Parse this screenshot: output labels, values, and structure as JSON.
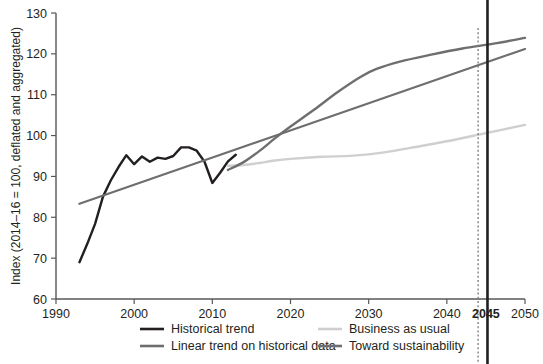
{
  "chart_data": {
    "type": "line",
    "title": "",
    "xlabel": "",
    "ylabel": "Index (2014–16 = 100, deflated and aggregated)",
    "xlim": [
      1990,
      2050
    ],
    "ylim": [
      60,
      130
    ],
    "xticks": [
      1990,
      2000,
      2010,
      2020,
      2030,
      2040,
      2050
    ],
    "yticks": [
      60,
      70,
      80,
      90,
      100,
      110,
      120,
      130
    ],
    "grid": false,
    "legend_position": "bottom",
    "annotations": [
      {
        "name": "target-year-marker",
        "label": "2045",
        "x": 2045,
        "style": "bold-vertical-line"
      },
      {
        "name": "target-year-dotted",
        "x": 2044,
        "style": "dotted-vertical-line"
      }
    ],
    "series": [
      {
        "name": "Historical trend",
        "color": "#231f20",
        "width": 2.4,
        "points": [
          [
            1993,
            69.0
          ],
          [
            1994,
            73.5
          ],
          [
            1995,
            78.4
          ],
          [
            1996,
            85.0
          ],
          [
            1997,
            89.0
          ],
          [
            1998,
            92.3
          ],
          [
            1999,
            95.2
          ],
          [
            2000,
            93.0
          ],
          [
            2001,
            94.9
          ],
          [
            2002,
            93.6
          ],
          [
            2003,
            94.6
          ],
          [
            2004,
            94.3
          ],
          [
            2005,
            95.0
          ],
          [
            2006,
            97.1
          ],
          [
            2007,
            97.1
          ],
          [
            2008,
            96.3
          ],
          [
            2009,
            93.6
          ],
          [
            2010,
            88.4
          ],
          [
            2011,
            90.9
          ],
          [
            2012,
            93.7
          ],
          [
            2013,
            95.3
          ]
        ]
      },
      {
        "name": "Linear trend on historical data",
        "color": "#6e6e70",
        "width": 2.2,
        "points": [
          [
            1993,
            83.3
          ],
          [
            2050,
            121.2
          ]
        ]
      },
      {
        "name": "Business as usual",
        "color": "#cfcfd1",
        "width": 2.4,
        "points": [
          [
            2012,
            92.6
          ],
          [
            2014,
            92.8
          ],
          [
            2016,
            93.3
          ],
          [
            2018,
            93.9
          ],
          [
            2020,
            94.3
          ],
          [
            2024,
            94.8
          ],
          [
            2028,
            95.1
          ],
          [
            2032,
            95.9
          ],
          [
            2036,
            97.2
          ],
          [
            2040,
            98.6
          ],
          [
            2045,
            100.6
          ],
          [
            2050,
            102.6
          ]
        ]
      },
      {
        "name": "Toward sustainability",
        "color": "#6e6e70",
        "width": 2.4,
        "points": [
          [
            2012,
            91.6
          ],
          [
            2014,
            93.5
          ],
          [
            2016,
            96.2
          ],
          [
            2018,
            99.3
          ],
          [
            2020,
            102.2
          ],
          [
            2023,
            106.3
          ],
          [
            2026,
            110.6
          ],
          [
            2029,
            114.4
          ],
          [
            2031,
            116.3
          ],
          [
            2034,
            118.1
          ],
          [
            2038,
            119.8
          ],
          [
            2042,
            121.3
          ],
          [
            2046,
            122.5
          ],
          [
            2050,
            123.9
          ]
        ]
      }
    ],
    "legend": [
      {
        "label": "Historical trend",
        "color": "#231f20",
        "column": 0,
        "row": 0
      },
      {
        "label": "Linear trend on historical data",
        "color": "#6e6e70",
        "column": 0,
        "row": 1
      },
      {
        "label": "Business as usual",
        "color": "#cfcfd1",
        "column": 1,
        "row": 0
      },
      {
        "label": "Toward sustainability",
        "color": "#6e6e70",
        "column": 1,
        "row": 1
      }
    ]
  }
}
